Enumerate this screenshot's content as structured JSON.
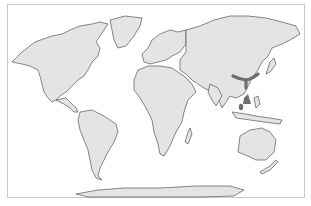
{
  "map": {
    "type": "world-distribution-map",
    "projection": "equirectangular-like",
    "colors": {
      "land": "#e4e4e4",
      "coastline": "#3a3a3a",
      "ocean": "#ffffff",
      "range_highlight": "#6e6e6e",
      "frame": "#c8c8c8"
    },
    "highlighted_region": {
      "label": "Distribution range",
      "location": "Central & Southern China, Southeast Asia"
    }
  }
}
